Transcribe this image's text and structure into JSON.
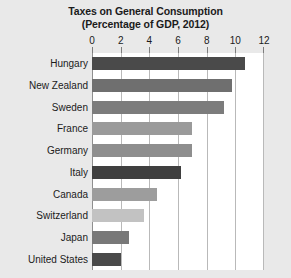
{
  "chart_data": {
    "type": "bar",
    "orientation": "horizontal",
    "title": "Taxes on General Consumption",
    "subtitle": "(Percentage of GDP, 2012)",
    "xlabel": "",
    "ylabel": "",
    "xlim": [
      0,
      12
    ],
    "xticks": [
      0,
      2,
      4,
      6,
      8,
      10,
      12
    ],
    "xtick_labels": [
      "0",
      "2",
      "4",
      "6",
      "8",
      "10",
      "12"
    ],
    "grid": true,
    "legend": "none",
    "categories": [
      "Hungary",
      "New Zealand",
      "Sweden",
      "France",
      "Germany",
      "Italy",
      "Canada",
      "Switzerland",
      "Japan",
      "United States"
    ],
    "values": [
      10.7,
      9.8,
      9.2,
      7.0,
      7.0,
      6.2,
      4.5,
      3.6,
      2.6,
      2.0
    ],
    "bar_colors": [
      "#4a4a4a",
      "#6f6f6f",
      "#7c7c7c",
      "#9a9a9a",
      "#8e8e8e",
      "#3f3f3f",
      "#9d9d9d",
      "#c2c2c2",
      "#787878",
      "#4a4a4a"
    ]
  },
  "style": {
    "page_background": "#e9e9e9",
    "plot_background": "#ffffff",
    "gridline_color": "#b9b9b9",
    "axis_color": "#8f8f8f",
    "text_color": "#1b1b1b"
  }
}
